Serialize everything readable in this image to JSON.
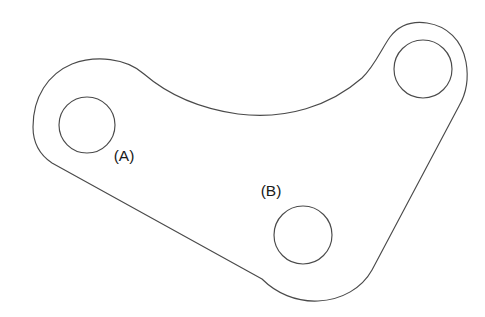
{
  "figure": {
    "kind": "engineering-line-drawing",
    "background_color": "#ffffff",
    "outline_color": "#4a4a4a",
    "label_color": "#1a1a1a",
    "stroke_width": 1.15,
    "canvas": {
      "width": 485,
      "height": 317
    }
  },
  "holes": [
    {
      "id": "hole-a",
      "label": "(A)",
      "center_x": 87,
      "center_y": 125,
      "radius": 28,
      "label_x": 124,
      "label_y": 161
    },
    {
      "id": "hole-top-right",
      "label": "",
      "center_x": 423,
      "center_y": 69,
      "radius": 29,
      "label_x": 0,
      "label_y": 0
    },
    {
      "id": "hole-b",
      "label": "(B)",
      "center_x": 303,
      "center_y": 235,
      "radius": 29,
      "label_x": 271,
      "label_y": 196
    }
  ],
  "outline": {
    "path": "M 33 127 C 33 97, 48 74, 72 64 C 96 55, 126 58, 144 74 C 166 93, 196 108, 238 114 C 286 120, 330 106, 362 78 C 374 67, 382 48, 390 37 C 400 24, 413 21, 427 23 C 447 26, 462 40, 466 62 C 469 79, 466 94, 459 106 L 372 270 C 362 288, 342 300, 318 301 C 296 302, 276 293, 262 279 L 52 163 C 40 155, 33 142, 33 127 Z"
  },
  "labels": {
    "a": "(A)",
    "b": "(B)"
  }
}
